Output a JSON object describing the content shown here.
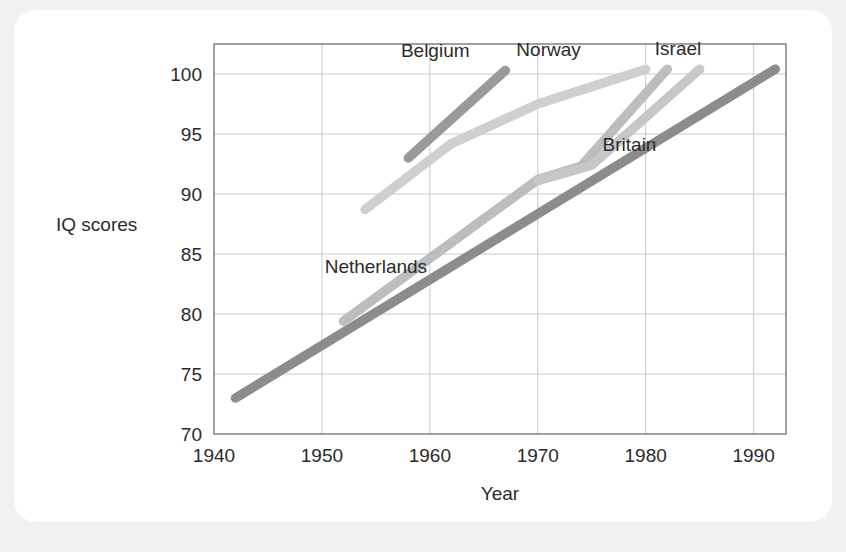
{
  "chart_data": {
    "type": "line",
    "title": "",
    "xlabel": "Year",
    "ylabel": "IQ scores",
    "xlim": [
      1940,
      1993
    ],
    "ylim": [
      70,
      102.5
    ],
    "xticks": [
      1940,
      1950,
      1960,
      1970,
      1980,
      1990
    ],
    "yticks": [
      70,
      75,
      80,
      85,
      90,
      95,
      100
    ],
    "grid": true,
    "legend_position": "inline-labels",
    "series": [
      {
        "name": "Britain",
        "color": "#8c8c8c",
        "label_x": 1978.5,
        "label_y": 93.6,
        "x": [
          1942,
          1992
        ],
        "y": [
          73.0,
          100.4
        ]
      },
      {
        "name": "Belgium",
        "color": "#9a9a9a",
        "label_x": 1960.5,
        "label_y": 101.4,
        "x": [
          1958,
          1967
        ],
        "y": [
          93.0,
          100.3
        ]
      },
      {
        "name": "Netherlands",
        "color": "#cfcfcf",
        "label_x": 1955.0,
        "label_y": 83.4,
        "x": [
          1954,
          1962,
          1970,
          1980
        ],
        "y": [
          88.7,
          94.2,
          97.5,
          100.4
        ]
      },
      {
        "name": "Norway",
        "color": "#bdbdbd",
        "label_x": 1971.0,
        "label_y": 101.5,
        "x": [
          1952,
          1970,
          1974,
          1982
        ],
        "y": [
          79.4,
          91.2,
          92.3,
          100.4
        ]
      },
      {
        "name": "Israel",
        "color": "#c7c7c7",
        "label_x": 1983.0,
        "label_y": 101.6,
        "x": [
          1970,
          1975,
          1985
        ],
        "y": [
          91.1,
          92.4,
          100.4
        ]
      }
    ]
  }
}
